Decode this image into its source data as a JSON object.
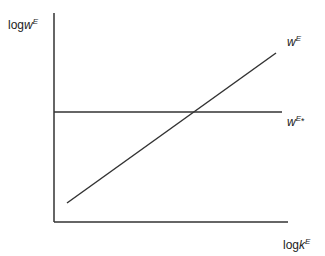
{
  "diagram": {
    "type": "economic-graph",
    "y_axis": {
      "label_prefix": "log",
      "label_var": "w",
      "label_sup": "E"
    },
    "x_axis": {
      "label_prefix": "log",
      "label_var": "k",
      "label_sup": "E"
    },
    "curves": [
      {
        "name": "w^E",
        "label_var": "w",
        "label_sup": "E",
        "shape": "upward-sloping line",
        "from": [
          67,
          203
        ],
        "to": [
          276,
          53
        ]
      },
      {
        "name": "w^E*",
        "label_var": "w",
        "label_sup": "E",
        "label_star": "*",
        "shape": "horizontal line",
        "from": [
          54,
          112
        ],
        "to": [
          282,
          112
        ]
      }
    ],
    "axes_geometry": {
      "origin": [
        54,
        222
      ],
      "y_top": 13,
      "x_right": 288
    },
    "colors": {
      "line": "#333333",
      "text": "#222222",
      "background": "#ffffff"
    }
  }
}
